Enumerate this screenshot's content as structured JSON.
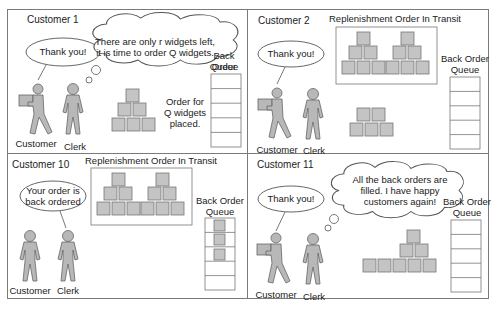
{
  "colors": {
    "figure_fill": "#b8b8b8",
    "figure_stroke": "#666666",
    "box_fill": "#c4c4c4",
    "box_stroke": "#777777",
    "frame": "#7a7a7a"
  },
  "panels": [
    {
      "title": "Customer 1",
      "customer_speech": "Thank you!",
      "clerk_thought": [
        "There are only r widgets left,",
        "it is time to order Q widgets."
      ],
      "queue_label": [
        "Back Order",
        "Queue"
      ],
      "note": [
        "Order for",
        "Q widgets",
        "placed."
      ],
      "customer_label": "Customer",
      "clerk_label": "Clerk",
      "inventory_boxes": 6,
      "queue_filled": 0
    },
    {
      "title": "Customer 2",
      "transit_label": "Replenishment Order In Transit",
      "customer_speech": "Thank you!",
      "queue_label": [
        "Back Order",
        "Queue"
      ],
      "customer_label": "Customer",
      "clerk_label": "Clerk",
      "inventory_boxes": 5,
      "queue_filled": 0
    },
    {
      "title": "Customer 10",
      "transit_label": "Replenishment Order In Transit",
      "clerk_speech": [
        "Your order is",
        "back ordered"
      ],
      "queue_label": [
        "Back Order",
        "Queue"
      ],
      "customer_label": "Customer",
      "clerk_label": "Clerk",
      "inventory_boxes": 0,
      "queue_filled": 3
    },
    {
      "title": "Customer 11",
      "customer_speech": "Thank you!",
      "clerk_thought": [
        "All the back orders are",
        "filled.  I have happy",
        "customers again!"
      ],
      "queue_label": [
        "Back Order",
        "Queue"
      ],
      "customer_label": "Customer",
      "clerk_label": "Clerk",
      "inventory_boxes": 8,
      "queue_filled": 0
    }
  ]
}
